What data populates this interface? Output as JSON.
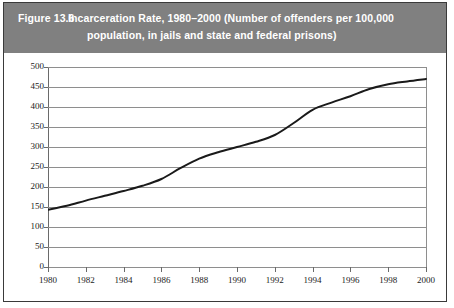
{
  "figure": {
    "label": "Figure 13.6",
    "title_line_1": "Incarceration Rate, 1980–2000  (Number of offenders per 100,000",
    "title_line_2": "population, in jails and state and federal prisons)",
    "header_bg": "#808080",
    "header_text_color": "#ffffff",
    "border_color": "#3a3a3a"
  },
  "chart_data": {
    "type": "line",
    "title": "Incarceration Rate, 1980–2000 (Number of offenders per 100,000 population, in jails and state and federal prisons)",
    "xlabel": "",
    "ylabel": "",
    "xlim": [
      1980,
      2000
    ],
    "ylim": [
      0,
      500
    ],
    "ytick_step": 50,
    "xtick_step": 2,
    "grid": "horizontal",
    "legend": "none",
    "line_color": "#1a1a1a",
    "line_width": 2,
    "x_tick_labels": [
      "1980",
      "1982",
      "1984",
      "1986",
      "1988",
      "1990",
      "1992",
      "1994",
      "1996",
      "1998",
      "2000"
    ],
    "y_tick_labels": [
      "0",
      "50",
      "100",
      "150",
      "200",
      "250",
      "300",
      "350",
      "400",
      "450",
      "500"
    ],
    "x": [
      1980,
      1981,
      1982,
      1983,
      1984,
      1985,
      1986,
      1987,
      1988,
      1989,
      1990,
      1991,
      1992,
      1993,
      1994,
      1995,
      1996,
      1997,
      1998,
      1999,
      2000
    ],
    "values": [
      143,
      153,
      166,
      178,
      190,
      203,
      220,
      247,
      271,
      287,
      300,
      313,
      330,
      360,
      393,
      411,
      427,
      445,
      457,
      464,
      470
    ],
    "series": [
      {
        "name": "Incarceration rate per 100,000 population",
        "values": [
          143,
          153,
          166,
          178,
          190,
          203,
          220,
          247,
          271,
          287,
          300,
          313,
          330,
          360,
          393,
          411,
          427,
          445,
          457,
          464,
          470
        ]
      }
    ]
  }
}
